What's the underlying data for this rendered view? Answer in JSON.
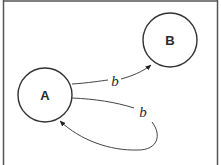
{
  "diagram": {
    "type": "state-diagram",
    "frame": {
      "stroke": "#555555"
    },
    "nodes": [
      {
        "id": "A",
        "label": "A",
        "cx": 45,
        "cy": 95,
        "r": 27
      },
      {
        "id": "B",
        "label": "B",
        "cx": 170,
        "cy": 40,
        "r": 27
      }
    ],
    "edges": [
      {
        "from": "A",
        "to": "B",
        "label": "b"
      },
      {
        "from": "A",
        "to": "A",
        "label": "b"
      }
    ],
    "colors": {
      "stroke": "#333333",
      "text": "#2a2a2a",
      "background": "#ffffff"
    }
  }
}
